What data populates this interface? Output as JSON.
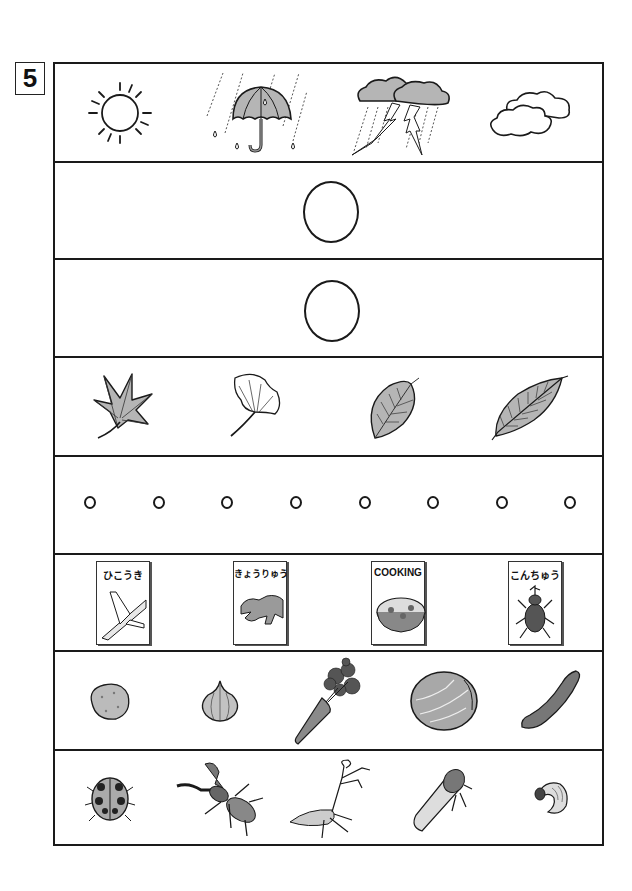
{
  "question_number": "5",
  "rows": [
    {
      "category": "weather",
      "items": [
        {
          "name": "sun",
          "icon": "sun-icon"
        },
        {
          "name": "rain with umbrella",
          "icon": "umbrella-rain-icon"
        },
        {
          "name": "thunderstorm",
          "icon": "thunderstorm-icon"
        },
        {
          "name": "cloudy",
          "icon": "cloud-icon"
        }
      ]
    },
    {
      "category": "answer-circle",
      "items": [
        {
          "name": "large circle",
          "icon": "circle-icon"
        }
      ]
    },
    {
      "category": "answer-circle",
      "items": [
        {
          "name": "large circle",
          "icon": "circle-icon"
        }
      ]
    },
    {
      "category": "leaves",
      "items": [
        {
          "name": "maple leaf",
          "icon": "maple-leaf-icon"
        },
        {
          "name": "ginkgo leaf",
          "icon": "ginkgo-leaf-icon"
        },
        {
          "name": "oval leaf",
          "icon": "oval-leaf-icon"
        },
        {
          "name": "cherry leaf",
          "icon": "serrated-leaf-icon"
        }
      ]
    },
    {
      "category": "small-circles",
      "count": 8
    },
    {
      "category": "books",
      "items": [
        {
          "title": "ひこうき",
          "icon": "airplane-icon"
        },
        {
          "title": "きょうりゅう",
          "icon": "dinosaur-icon"
        },
        {
          "title": "COOKING",
          "icon": "gratin-dish-icon"
        },
        {
          "title": "こんちゅう",
          "icon": "beetle-icon"
        }
      ]
    },
    {
      "category": "vegetables",
      "items": [
        {
          "name": "potato",
          "icon": "potato-icon"
        },
        {
          "name": "onion",
          "icon": "onion-icon"
        },
        {
          "name": "carrot",
          "icon": "carrot-icon"
        },
        {
          "name": "cabbage",
          "icon": "cabbage-icon"
        },
        {
          "name": "cucumber",
          "icon": "cucumber-icon"
        }
      ]
    },
    {
      "category": "insects",
      "items": [
        {
          "name": "ladybug",
          "icon": "ladybug-icon"
        },
        {
          "name": "stag beetle",
          "icon": "stag-beetle-icon"
        },
        {
          "name": "praying mantis",
          "icon": "mantis-icon"
        },
        {
          "name": "cicada",
          "icon": "cicada-icon"
        },
        {
          "name": "grub",
          "icon": "grub-icon"
        }
      ]
    }
  ],
  "colors": {
    "line": "#1a1a1a",
    "gray_fill": "#b8b8b8",
    "dark_fill": "#6e6e6e"
  }
}
